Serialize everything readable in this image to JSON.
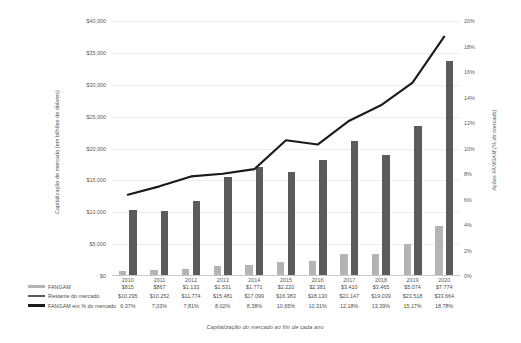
{
  "chart_data": {
    "type": "bar",
    "title": "",
    "subtitle": "",
    "xlabel": "Capitalização do mercado ao fim de cada ano",
    "ylabel": "Capitalização de mercado (em bilhões de dólares)",
    "y2label": "Ações FANGAM (% do mercado)",
    "grid": true,
    "legend_position": "bottom-left",
    "categories": [
      "2010",
      "2011",
      "2012",
      "2013",
      "2014",
      "2015",
      "2016",
      "2017",
      "2018",
      "2019",
      "2020"
    ],
    "ylim": [
      0,
      40000
    ],
    "y2lim": [
      0,
      20
    ],
    "y_ticks": [
      "$0",
      "$5,000",
      "$10,000",
      "$15,000",
      "$20,000",
      "$25,000",
      "$30,000",
      "$35,000",
      "$40,000"
    ],
    "y_tick_values": [
      0,
      5000,
      10000,
      15000,
      20000,
      25000,
      30000,
      35000,
      40000
    ],
    "y2_ticks": [
      "0%",
      "2%",
      "4%",
      "6%",
      "8%",
      "10%",
      "12%",
      "14%",
      "16%",
      "18%",
      "20%"
    ],
    "y2_tick_values": [
      0,
      2,
      4,
      6,
      8,
      10,
      12,
      14,
      16,
      18,
      20
    ],
    "series": [
      {
        "name": "FANGAM",
        "kind": "bar",
        "color": "#b4b4b4",
        "axis": "left",
        "values": [
          815,
          867,
          1133,
          1531,
          1771,
          2220,
          2381,
          3410,
          3465,
          5074,
          7774
        ],
        "labels": [
          "$815",
          "$867",
          "$1.133",
          "$1.531",
          "$1.771",
          "$2.220",
          "$2.381",
          "$3.410",
          "$3.465",
          "$5.074",
          "$7.774"
        ]
      },
      {
        "name": "Restante do mercado",
        "kind": "bar",
        "color": "#5b5b5b",
        "axis": "left",
        "values": [
          10295,
          10252,
          11774,
          15481,
          17099,
          16383,
          18130,
          21147,
          19039,
          23518,
          33664
        ],
        "labels": [
          "$10.295",
          "$10.252",
          "$11.774",
          "$15.481",
          "$17.099",
          "$16.383",
          "$18.130",
          "$21.147",
          "$19.039",
          "$23.518",
          "$33.664"
        ]
      },
      {
        "name": "FANGAM em % do mercado",
        "kind": "line",
        "color": "#1a1a1a",
        "axis": "right",
        "values": [
          6.37,
          7.03,
          7.81,
          8.02,
          8.38,
          10.65,
          10.31,
          12.18,
          13.39,
          15.17,
          18.78
        ],
        "labels": [
          "6,37%",
          "7,03%",
          "7,81%",
          "8,02%",
          "8,38%",
          "10,65%",
          "10,31%",
          "12,18%",
          "13,39%",
          "15,17%",
          "18,78%"
        ]
      }
    ]
  }
}
